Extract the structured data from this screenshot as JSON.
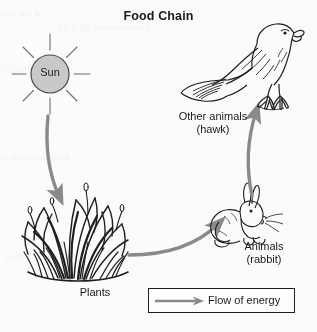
{
  "title": "Food Chain",
  "nodes": {
    "sun": {
      "label": "Sun",
      "shape": "circle-with-rays",
      "fill": "#c9c9c9",
      "stroke": "#4a4a4a"
    },
    "plants": {
      "label": "Plants",
      "icon": "grass-clump-illustration"
    },
    "rabbit": {
      "label": "Animals",
      "sublabel": "(rabbit)",
      "icon": "rabbit-illustration"
    },
    "hawk": {
      "label": "Other animals",
      "sublabel": "(hawk)",
      "icon": "hawk-illustration"
    }
  },
  "arrows": [
    {
      "name": "sun-to-plants",
      "from": "sun",
      "to": "plants"
    },
    {
      "name": "plants-to-rabbit",
      "from": "plants",
      "to": "rabbit"
    },
    {
      "name": "rabbit-to-hawk",
      "from": "rabbit",
      "to": "hawk"
    }
  ],
  "legend": {
    "label": "Flow of energy",
    "arrow_icon": "right-arrow-icon"
  },
  "colors": {
    "arrow": "#8a8a8a",
    "ink": "#1a1a1a",
    "sun_fill": "#c9c9c9",
    "page": "#fbfbfa"
  },
  "bleed_through": [
    "a tap water ang labile",
    "naramdaman ng mga",
    "ito ay nagbibigay",
    "mga halaman at hayop",
    "sa mundo ng buhay"
  ]
}
